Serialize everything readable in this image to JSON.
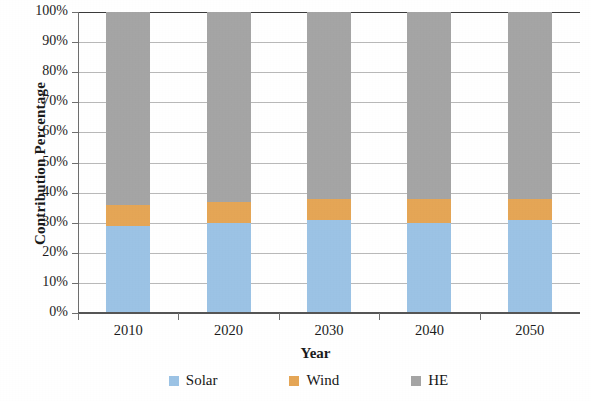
{
  "chart_data": {
    "type": "bar",
    "subtype": "stacked-percentage-column",
    "title": "",
    "xlabel": "Year",
    "ylabel": "Contribution Percentage",
    "categories": [
      "2010",
      "2020",
      "2030",
      "2040",
      "2050"
    ],
    "series": [
      {
        "name": "Solar",
        "color": "#9CC3E5",
        "values": [
          29,
          30,
          31,
          30,
          31
        ]
      },
      {
        "name": "Wind",
        "color": "#E5A656",
        "values": [
          7,
          7,
          7,
          8,
          7
        ]
      },
      {
        "name": "HE",
        "color": "#A5A5A5",
        "values": [
          64,
          63,
          62,
          62,
          62
        ]
      }
    ],
    "ylim": [
      0,
      100
    ],
    "ytick_labels": [
      "100%",
      "90%",
      "80%",
      "70%",
      "60%",
      "50%",
      "40%",
      "30%",
      "20%",
      "10%",
      "0%"
    ],
    "ytick_values": [
      100,
      90,
      80,
      70,
      60,
      50,
      40,
      30,
      20,
      10,
      0
    ],
    "yaxis_unit": "%",
    "grid": true,
    "grid_axis": "y",
    "legend_position": "bottom",
    "legend_entries": [
      {
        "label": "Solar",
        "color": "#9CC3E5"
      },
      {
        "label": "Wind",
        "color": "#E5A656"
      },
      {
        "label": "HE",
        "color": "#A5A5A5"
      }
    ],
    "background": "#FFFFFF",
    "axis_color": "#6F6F6F",
    "gridline_color": "#B9B9B9"
  }
}
